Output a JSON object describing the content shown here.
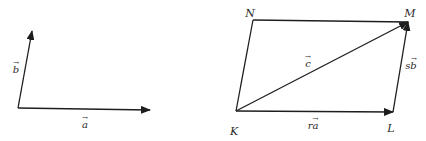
{
  "colors": {
    "background": "#ffffff",
    "stroke": "#1e1e1e",
    "text": "#2a2a2a"
  },
  "left_figure": {
    "origin": {
      "x": 18,
      "y": 108
    },
    "vectors": [
      {
        "id": "a",
        "label": "a",
        "arrow": "→",
        "from": {
          "x": 18,
          "y": 108
        },
        "to": {
          "x": 150,
          "y": 110
        },
        "label_pos": {
          "x": 85,
          "y": 122
        }
      },
      {
        "id": "b",
        "label": "b",
        "arrow": "→",
        "from": {
          "x": 18,
          "y": 108
        },
        "to": {
          "x": 32,
          "y": 31
        },
        "label_pos": {
          "x": 16,
          "y": 67
        }
      }
    ]
  },
  "right_figure": {
    "points": [
      {
        "id": "K",
        "label": "K",
        "x": 236,
        "y": 111,
        "label_pos": {
          "x": 234,
          "y": 131
        }
      },
      {
        "id": "L",
        "label": "L",
        "x": 393,
        "y": 112,
        "label_pos": {
          "x": 391,
          "y": 128
        }
      },
      {
        "id": "M",
        "label": "M",
        "x": 408,
        "y": 22,
        "label_pos": {
          "x": 410,
          "y": 13
        }
      },
      {
        "id": "N",
        "label": "N",
        "x": 253,
        "y": 20,
        "label_pos": {
          "x": 250,
          "y": 13
        }
      }
    ],
    "vectors": [
      {
        "id": "ra",
        "label": "ra",
        "arrow": "→",
        "from": "K",
        "to": "L",
        "label_pos": {
          "x": 313,
          "y": 123
        }
      },
      {
        "id": "sb",
        "label": "sb",
        "arrow": "→",
        "from": "L",
        "to": "M",
        "label_pos": {
          "x": 411,
          "y": 63
        }
      },
      {
        "id": "c",
        "label": "c",
        "arrow": "→",
        "from": "K",
        "to": "M",
        "label_pos": {
          "x": 308,
          "y": 61
        }
      }
    ],
    "segments": [
      {
        "from": "K",
        "to": "N"
      },
      {
        "from": "N",
        "to": "M"
      }
    ]
  }
}
